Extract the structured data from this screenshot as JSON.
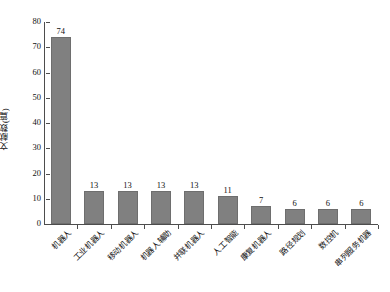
{
  "chart_data": {
    "type": "bar",
    "title": "",
    "xlabel": "",
    "ylabel": "文献数(篇)",
    "ylim": [
      0,
      80
    ],
    "ytick_step": 10,
    "yticks": [
      0,
      10,
      20,
      30,
      40,
      50,
      60,
      70,
      80
    ],
    "grid": false,
    "legend": null,
    "bar_color": "#808080",
    "bar_edge_color": "#6e6e6e",
    "background": "#ffffff",
    "axis_color": "#4d4d4d",
    "categories": [
      "机器人",
      "工业机器人",
      "移动机器人",
      "机器人辅助",
      "并联机器人",
      "人工智能",
      "康复机器人",
      "路径规划",
      "数控机",
      "串列服务机器"
    ],
    "values": [
      74,
      13,
      13,
      13,
      13,
      11,
      7,
      6,
      6,
      6
    ],
    "value_labels": [
      "74",
      "13",
      "13",
      "13",
      "13",
      "11",
      "7",
      "6",
      "6",
      "6"
    ]
  }
}
